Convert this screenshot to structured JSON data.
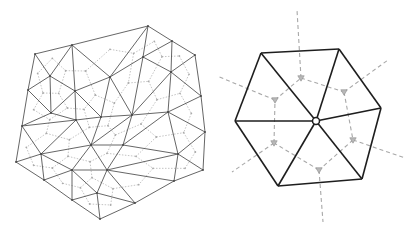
{
  "figure": {
    "colors": {
      "background": "#ffffff",
      "mesh_edge": "#555555",
      "dual_edge": "#b5b5b5",
      "hex_edge": "#1e1e1e",
      "hex_dual": "#a8a8a8"
    }
  },
  "left_mesh": {
    "vertices": [
      [
        35,
        54
      ],
      [
        72,
        45
      ],
      [
        148,
        26
      ],
      [
        172,
        41
      ],
      [
        195,
        55
      ],
      [
        201,
        96
      ],
      [
        205,
        132
      ],
      [
        203,
        170
      ],
      [
        174,
        181
      ],
      [
        135,
        203
      ],
      [
        100,
        219
      ],
      [
        72,
        200
      ],
      [
        44,
        180
      ],
      [
        16,
        162
      ],
      [
        22,
        126
      ],
      [
        28,
        90
      ],
      [
        50,
        76
      ],
      [
        110,
        77
      ],
      [
        143,
        57
      ],
      [
        171,
        72
      ],
      [
        75,
        91
      ],
      [
        51,
        113
      ],
      [
        101,
        117
      ],
      [
        132,
        115
      ],
      [
        168,
        112
      ],
      [
        76,
        120
      ],
      [
        91,
        145
      ],
      [
        123,
        145
      ],
      [
        178,
        154
      ],
      [
        41,
        154
      ],
      [
        72,
        170
      ],
      [
        107,
        170
      ],
      [
        97,
        193
      ]
    ],
    "triangles": [
      [
        0,
        1,
        16
      ],
      [
        1,
        20,
        16
      ],
      [
        1,
        17,
        20
      ],
      [
        1,
        2,
        17
      ],
      [
        2,
        18,
        17
      ],
      [
        2,
        3,
        18
      ],
      [
        3,
        19,
        18
      ],
      [
        3,
        4,
        19
      ],
      [
        4,
        5,
        19
      ],
      [
        0,
        16,
        15
      ],
      [
        15,
        16,
        21
      ],
      [
        16,
        20,
        21
      ],
      [
        20,
        17,
        22
      ],
      [
        17,
        23,
        22
      ],
      [
        17,
        18,
        23
      ],
      [
        18,
        19,
        23
      ],
      [
        19,
        24,
        23
      ],
      [
        19,
        5,
        24
      ],
      [
        15,
        21,
        14
      ],
      [
        21,
        25,
        14
      ],
      [
        21,
        20,
        25
      ],
      [
        20,
        22,
        25
      ],
      [
        22,
        26,
        25
      ],
      [
        22,
        23,
        26
      ],
      [
        23,
        27,
        26
      ],
      [
        23,
        24,
        27
      ],
      [
        24,
        28,
        27
      ],
      [
        24,
        5,
        6
      ],
      [
        24,
        6,
        28
      ],
      [
        14,
        25,
        29
      ],
      [
        14,
        29,
        13
      ],
      [
        25,
        26,
        29
      ],
      [
        29,
        26,
        30
      ],
      [
        26,
        31,
        30
      ],
      [
        26,
        27,
        31
      ],
      [
        27,
        28,
        31
      ],
      [
        28,
        8,
        31
      ],
      [
        28,
        6,
        7
      ],
      [
        28,
        7,
        8
      ],
      [
        13,
        29,
        12
      ],
      [
        29,
        30,
        12
      ],
      [
        12,
        30,
        11
      ],
      [
        30,
        32,
        11
      ],
      [
        30,
        31,
        32
      ],
      [
        31,
        9,
        32
      ],
      [
        31,
        8,
        9
      ],
      [
        11,
        32,
        10
      ],
      [
        32,
        9,
        10
      ]
    ]
  },
  "right_hexagon": {
    "center": [
      316,
      121
    ],
    "vertices": [
      [
        261,
        53
      ],
      [
        339,
        49
      ],
      [
        381,
        108
      ],
      [
        362,
        179
      ],
      [
        278,
        186
      ],
      [
        235,
        121
      ]
    ],
    "centroids": [
      [
        301,
        78
      ],
      [
        344,
        92
      ],
      [
        353,
        140
      ],
      [
        319,
        170
      ],
      [
        274,
        143
      ],
      [
        275,
        100
      ]
    ],
    "rays": [
      [
        [
          301,
          78
        ],
        [
          297,
          10
        ]
      ],
      [
        [
          344,
          92
        ],
        [
          388,
          60
        ]
      ],
      [
        [
          353,
          140
        ],
        [
          405,
          158
        ]
      ],
      [
        [
          319,
          170
        ],
        [
          323,
          222
        ]
      ],
      [
        [
          274,
          143
        ],
        [
          232,
          172
        ]
      ],
      [
        [
          275,
          100
        ],
        [
          217,
          76
        ]
      ]
    ]
  }
}
